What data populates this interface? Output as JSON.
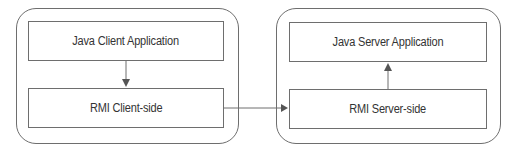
{
  "diagram": {
    "client": {
      "container_label": "Client",
      "top_box": "Java Client Application",
      "bottom_box": "RMI Client-side"
    },
    "server": {
      "container_label": "Server",
      "top_box": "Java Server Application",
      "bottom_box": "RMI Server-side"
    },
    "edges": [
      {
        "from": "Java Client Application",
        "to": "RMI Client-side",
        "direction": "down"
      },
      {
        "from": "RMI Client-side",
        "to": "RMI Server-side",
        "direction": "right"
      },
      {
        "from": "RMI Server-side",
        "to": "Java Server Application",
        "direction": "up"
      }
    ],
    "colors": {
      "stroke": "#6e6e6e",
      "text": "#333333",
      "background": "#ffffff"
    }
  }
}
